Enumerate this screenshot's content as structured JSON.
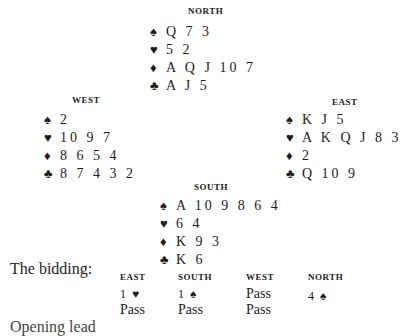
{
  "suits": {
    "spades": "♠",
    "hearts": "♥",
    "diamonds": "♦",
    "clubs": "♣"
  },
  "hands": {
    "north": {
      "label": "NORTH",
      "spades": "Q 7 3",
      "hearts": "5 2",
      "diamonds": "A Q J 10 7",
      "clubs": "A J 5"
    },
    "west": {
      "label": "WEST",
      "spades": "2",
      "hearts": "10 9 7",
      "diamonds": "8 6 5 4",
      "clubs": "8 7 4 3 2"
    },
    "east": {
      "label": "EAST",
      "spades": "K J 5",
      "hearts": "A K Q J 8 3",
      "diamonds": "2",
      "clubs": "Q 10 9"
    },
    "south": {
      "label": "SOUTH",
      "spades": "A 10 9 8 6 4",
      "hearts": "6 4",
      "diamonds": "K 9 3",
      "clubs": "K 6"
    }
  },
  "bidding": {
    "intro": "The bidding:",
    "columns": [
      {
        "label": "EAST",
        "bids": [
          {
            "level": "1",
            "suit": "♥"
          },
          {
            "text": "Pass"
          }
        ]
      },
      {
        "label": "SOUTH",
        "bids": [
          {
            "level": "1",
            "suit": "♠"
          },
          {
            "text": "Pass"
          }
        ]
      },
      {
        "label": "WEST",
        "bids": [
          {
            "text": "Pass"
          },
          {
            "text": "Pass"
          }
        ]
      },
      {
        "label": "NORTH",
        "bids": [
          {
            "level": "4",
            "suit": "♠"
          }
        ]
      }
    ]
  },
  "cutoff_text": "Opening lead"
}
